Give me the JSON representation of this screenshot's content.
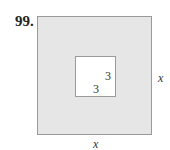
{
  "problem": {
    "number": "99."
  },
  "figure": {
    "outer_square": {
      "side_label_right": "x",
      "side_label_bottom": "x",
      "fill_color": "#e6e6e6",
      "border_color": "#9a9a9a"
    },
    "inner_square": {
      "side_label_right": "3",
      "side_label_bottom": "3",
      "fill_color": "#ffffff",
      "border_color": "#9a9a9a"
    }
  }
}
